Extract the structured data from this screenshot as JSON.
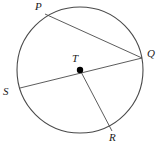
{
  "figure": {
    "type": "circle-geometry-diagram",
    "canvas": {
      "width": 164,
      "height": 147,
      "background": "#ffffff"
    },
    "stroke_color": "#4a4a4a",
    "label_color": "#1a1a1a",
    "circle": {
      "name": "circle-T",
      "center_x": 80,
      "center_y": 70,
      "radius": 63,
      "stroke_width": 1.1
    },
    "center_point": {
      "name": "center-dot-T",
      "x": 80,
      "y": 70,
      "dot_radius": 3.2,
      "fill": "#000000"
    },
    "points": [
      {
        "id": "P",
        "label": "P",
        "x": 45,
        "y": 14
      },
      {
        "id": "Q",
        "label": "Q",
        "x": 142,
        "y": 58
      },
      {
        "id": "R",
        "label": "R",
        "x": 112,
        "y": 131
      },
      {
        "id": "S",
        "label": "S",
        "x": 20,
        "y": 88
      },
      {
        "id": "T",
        "label": "T",
        "x": 80,
        "y": 70
      }
    ],
    "segments": [
      {
        "id": "PQ",
        "kind": "chord",
        "from": "P",
        "to": "Q",
        "x1": 45,
        "y1": 14,
        "x2": 142,
        "y2": 58
      },
      {
        "id": "SQ",
        "kind": "diameter",
        "from": "S",
        "to": "Q",
        "x1": 20,
        "y1": 88,
        "x2": 142,
        "y2": 58
      },
      {
        "id": "TR",
        "kind": "radius",
        "from": "T",
        "to": "R",
        "x1": 80,
        "y1": 70,
        "x2": 112,
        "y2": 131
      }
    ]
  },
  "labels": {
    "P": "P",
    "Q": "Q",
    "R": "R",
    "S": "S",
    "T": "T"
  }
}
